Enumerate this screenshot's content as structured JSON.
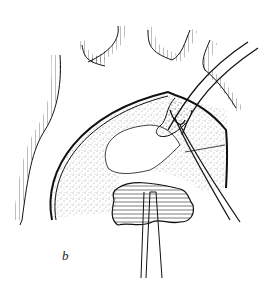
{
  "figure": {
    "panel_label": "b",
    "colors": {
      "ink": "#111111",
      "background": "#ffffff"
    }
  }
}
